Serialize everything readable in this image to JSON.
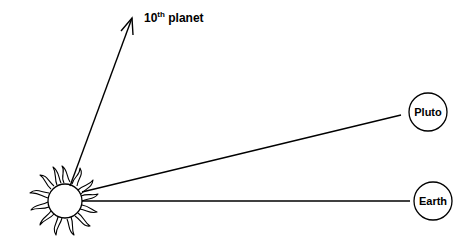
{
  "diagram": {
    "sun": {
      "label": ""
    },
    "arrow": {
      "label_main": "10",
      "label_sup": "th",
      "label_rest": " planet"
    },
    "planets": [
      {
        "name": "Pluto"
      },
      {
        "name": "Earth"
      }
    ]
  },
  "colors": {
    "stroke": "#000000",
    "background": "#ffffff"
  }
}
